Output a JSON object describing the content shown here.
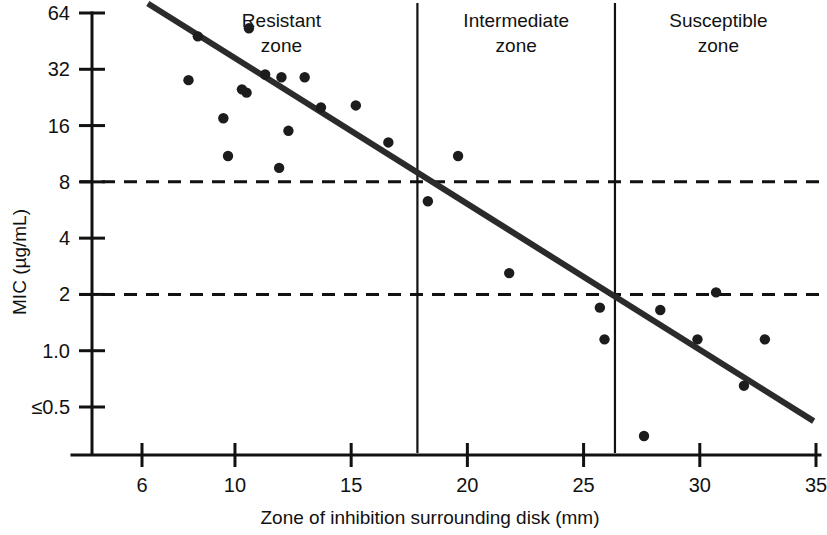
{
  "chart_data": {
    "type": "scatter",
    "title": "",
    "xlabel": "Zone of inhibition surrounding disk (mm)",
    "ylabel": "MIC (µg/mL)",
    "xlim": [
      4.2,
      35.8
    ],
    "ylim_log2": [
      -1.45,
      6.45
    ],
    "grid": false,
    "legend": "none",
    "x_ticks": [
      {
        "value": 6,
        "label": "6"
      },
      {
        "value": 10,
        "label": "10"
      },
      {
        "value": 15,
        "label": "15"
      },
      {
        "value": 20,
        "label": "20"
      },
      {
        "value": 25,
        "label": "25"
      },
      {
        "value": 30,
        "label": "30"
      },
      {
        "value": 35,
        "label": "35"
      }
    ],
    "y_ticks": [
      {
        "value": 64,
        "label": "64"
      },
      {
        "value": 32,
        "label": "32"
      },
      {
        "value": 16,
        "label": "16"
      },
      {
        "value": 8,
        "label": "8"
      },
      {
        "value": 4,
        "label": "4"
      },
      {
        "value": 2,
        "label": "2"
      },
      {
        "value": 1.0,
        "label": "1.0"
      },
      {
        "value": 0.5,
        "label": "≤0.5"
      }
    ],
    "points": [
      {
        "x": 8.0,
        "y": 28.0
      },
      {
        "x": 8.4,
        "y": 48.0
      },
      {
        "x": 9.5,
        "y": 17.5
      },
      {
        "x": 9.7,
        "y": 11.0
      },
      {
        "x": 10.3,
        "y": 25.0
      },
      {
        "x": 10.5,
        "y": 24.0
      },
      {
        "x": 10.6,
        "y": 53.0
      },
      {
        "x": 11.3,
        "y": 30.0
      },
      {
        "x": 11.9,
        "y": 9.5
      },
      {
        "x": 12.0,
        "y": 29.0
      },
      {
        "x": 12.3,
        "y": 15.0
      },
      {
        "x": 13.0,
        "y": 29.0
      },
      {
        "x": 13.7,
        "y": 20.0
      },
      {
        "x": 15.2,
        "y": 20.5
      },
      {
        "x": 16.6,
        "y": 13.0
      },
      {
        "x": 18.3,
        "y": 6.3
      },
      {
        "x": 19.6,
        "y": 11.0
      },
      {
        "x": 21.8,
        "y": 2.6
      },
      {
        "x": 25.7,
        "y": 1.7
      },
      {
        "x": 25.9,
        "y": 1.15
      },
      {
        "x": 27.6,
        "y": 0.35
      },
      {
        "x": 28.3,
        "y": 1.65
      },
      {
        "x": 29.9,
        "y": 1.15
      },
      {
        "x": 30.7,
        "y": 2.05
      },
      {
        "x": 31.9,
        "y": 0.65
      },
      {
        "x": 32.8,
        "y": 1.15
      }
    ],
    "regression_line": {
      "x_start": 6.25,
      "y_start": 72.0,
      "x_end": 34.9,
      "y_end": 0.42
    },
    "breakpoints_mic": [
      {
        "value": 8,
        "style": "dashed"
      },
      {
        "value": 2,
        "style": "dashed"
      }
    ],
    "zone_dividers_mm": [
      17.85,
      26.35
    ],
    "zones": [
      {
        "name": "resistant",
        "line1": "Resistant",
        "line2": "zone",
        "center_mm": 12.0
      },
      {
        "name": "intermediate",
        "line1": "Intermediate",
        "line2": "zone",
        "center_mm": 22.1
      },
      {
        "name": "susceptible",
        "line1": "Susceptible",
        "line2": "zone",
        "center_mm": 30.8
      }
    ],
    "colors": {
      "ink": "#111111",
      "point": "#1c1c1c",
      "regression": "#2b2b2b",
      "background": "#ffffff"
    }
  }
}
